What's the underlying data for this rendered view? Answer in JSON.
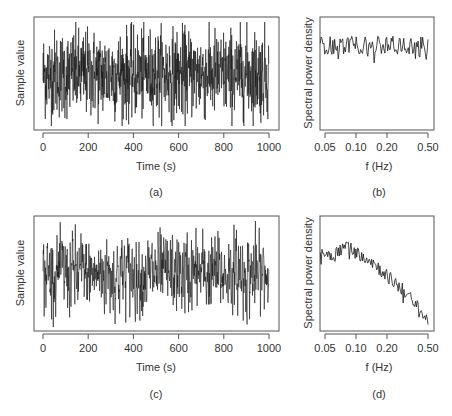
{
  "chart_data": [
    {
      "id": "a",
      "panel_label": "(a)",
      "type": "line",
      "title": "",
      "xlabel": "Time (s)",
      "ylabel": "Sample value",
      "xticks": [
        0,
        200,
        400,
        600,
        800,
        1000
      ],
      "xlim": [
        0,
        1000
      ],
      "n_points": 1000,
      "description": "White noise time series, uniform amplitude fluctuations across full range",
      "grid": false
    },
    {
      "id": "b",
      "panel_label": "(b)",
      "type": "line",
      "title": "",
      "xlabel": "f (Hz)",
      "ylabel": "Spectral power density",
      "xscale": "log",
      "xticks": [
        0.05,
        0.1,
        0.2,
        0.5
      ],
      "xtick_labels": [
        "0.05",
        "0.10",
        "0.20",
        "0.50"
      ],
      "xlim": [
        0.045,
        0.52
      ],
      "description": "Flat spectrum (white noise), level roughly constant at ~75% of axis height with random fluctuations",
      "approx_level_fraction": 0.75,
      "grid": false
    },
    {
      "id": "c",
      "panel_label": "(c)",
      "type": "line",
      "title": "",
      "xlabel": "Time (s)",
      "ylabel": "Sample value",
      "xticks": [
        0,
        200,
        400,
        600,
        800,
        1000
      ],
      "xlim": [
        0,
        1000
      ],
      "n_points": 1000,
      "description": "Low-pass filtered (colored) noise time series",
      "grid": false
    },
    {
      "id": "d",
      "panel_label": "(d)",
      "type": "line",
      "title": "",
      "xlabel": "f (Hz)",
      "ylabel": "Spectral power density",
      "xscale": "log",
      "xticks": [
        0.05,
        0.1,
        0.2,
        0.5
      ],
      "xtick_labels": [
        "0.05",
        "0.10",
        "0.20",
        "0.50"
      ],
      "xlim": [
        0.045,
        0.52
      ],
      "description": "Spectrum flat at low frequency then decaying above ~0.12 Hz",
      "approx_points": [
        {
          "f": 0.045,
          "level": 0.68
        },
        {
          "f": 0.06,
          "level": 0.66
        },
        {
          "f": 0.08,
          "level": 0.75
        },
        {
          "f": 0.1,
          "level": 0.68
        },
        {
          "f": 0.13,
          "level": 0.64
        },
        {
          "f": 0.2,
          "level": 0.48
        },
        {
          "f": 0.3,
          "level": 0.34
        },
        {
          "f": 0.4,
          "level": 0.2
        },
        {
          "f": 0.5,
          "level": 0.08
        }
      ],
      "grid": false
    }
  ],
  "labels": {
    "time_axis": "Time (s)",
    "freq_axis": "f (Hz)",
    "sample_value": "Sample value",
    "spectral_density": "Spectral power density",
    "cap_a": "(a)",
    "cap_b": "(b)",
    "cap_c": "(c)",
    "cap_d": "(d)",
    "time_ticks": [
      "0",
      "200",
      "400",
      "600",
      "800",
      "1000"
    ],
    "freq_ticks": [
      "0.05",
      "0.10",
      "0.20",
      "0.50"
    ]
  },
  "colors": {
    "line": "#1a1a1a",
    "frame": "#555555"
  }
}
